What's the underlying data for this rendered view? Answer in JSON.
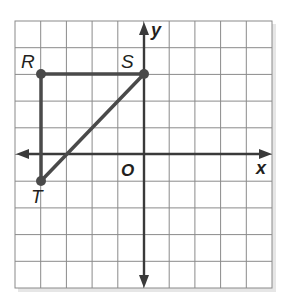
{
  "figure": {
    "type": "coordinate-grid",
    "grid": {
      "columns": 10,
      "rows": 10,
      "x_min": -5,
      "x_max": 5,
      "y_max": 5,
      "y_min": -5,
      "origin_col": 5,
      "origin_row": 5
    },
    "axes": {
      "x_label": "x",
      "y_label": "y",
      "origin_label": "O"
    },
    "points": [
      {
        "name": "R",
        "x": -4,
        "y": 3
      },
      {
        "name": "S",
        "x": 0,
        "y": 3
      },
      {
        "name": "T",
        "x": -4,
        "y": -1
      }
    ],
    "segments": [
      [
        "R",
        "S"
      ],
      [
        "R",
        "T"
      ],
      [
        "S",
        "T"
      ]
    ],
    "colors": {
      "grid": "#8a8a8a",
      "axis": "#3a3a3a",
      "shape": "#4a4a4a",
      "text": "#231f20",
      "shadow": "#d8d8d8"
    }
  }
}
